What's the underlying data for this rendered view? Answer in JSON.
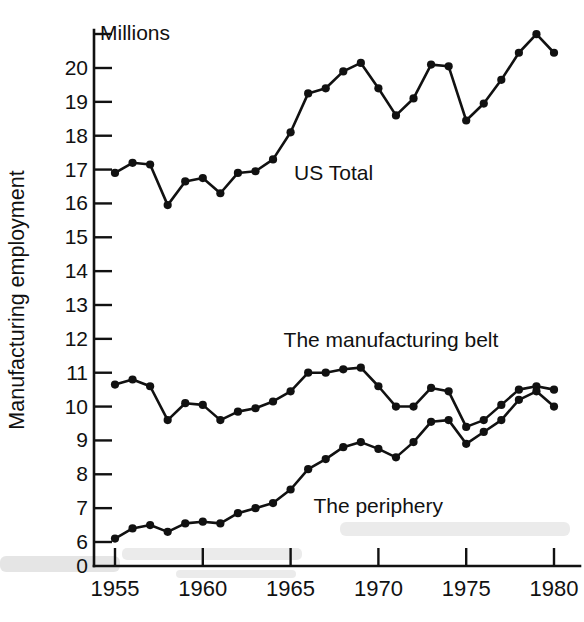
{
  "figure": {
    "unit_note": "Millions",
    "y_axis_title": "Manufacturing employment",
    "zero_label": "0"
  },
  "chart_data": {
    "type": "line",
    "title": "",
    "subtitle": "",
    "xlabel": "",
    "ylabel": "Manufacturing employment",
    "unit_note": "Millions",
    "grid": false,
    "legend_position": "inline-annotation",
    "xlim": [
      1954,
      1981
    ],
    "ylim": [
      5.6,
      21.2
    ],
    "yticks": [
      6,
      7,
      8,
      9,
      10,
      11,
      12,
      13,
      14,
      15,
      16,
      17,
      18,
      19,
      20
    ],
    "ytick_labels": [
      "6",
      "7",
      "8",
      "9",
      "10",
      "11",
      "12",
      "13",
      "14",
      "15",
      "16",
      "17",
      "18",
      "19",
      "20"
    ],
    "xticks": [
      1955,
      1960,
      1965,
      1970,
      1975,
      1980
    ],
    "xtick_labels": [
      "1955",
      "1960",
      "1965",
      "1970",
      "1975",
      "1980"
    ],
    "x": [
      1955,
      1956,
      1957,
      1958,
      1959,
      1960,
      1961,
      1962,
      1963,
      1964,
      1965,
      1966,
      1967,
      1968,
      1969,
      1970,
      1971,
      1972,
      1973,
      1974,
      1975,
      1976,
      1977,
      1978,
      1979,
      1980
    ],
    "series": [
      {
        "name": "US Total",
        "label": "US Total",
        "label_x": 1965.2,
        "label_y": 16.7,
        "values": [
          16.9,
          17.2,
          17.15,
          15.95,
          16.65,
          16.75,
          16.3,
          16.9,
          16.95,
          17.3,
          18.1,
          19.25,
          19.4,
          19.9,
          20.15,
          19.4,
          18.6,
          19.1,
          20.1,
          20.05,
          18.45,
          18.95,
          19.65,
          20.45,
          21.0,
          20.45
        ]
      },
      {
        "name": "The manufacturing belt",
        "label": "The manufacturing belt",
        "label_x": 1964.6,
        "label_y": 11.75,
        "values": [
          10.65,
          10.8,
          10.6,
          9.6,
          10.1,
          10.05,
          9.6,
          9.85,
          9.95,
          10.15,
          10.45,
          11.0,
          11.0,
          11.1,
          11.15,
          10.6,
          10.0,
          10.0,
          10.55,
          10.45,
          9.4,
          9.6,
          10.05,
          10.5,
          10.6,
          10.5
        ]
      },
      {
        "name": "The periphery",
        "label": "The periphery",
        "label_x": 1966.3,
        "label_y": 6.85,
        "values": [
          6.1,
          6.4,
          6.5,
          6.3,
          6.55,
          6.6,
          6.55,
          6.85,
          7.0,
          7.15,
          7.55,
          8.15,
          8.45,
          8.8,
          8.95,
          8.75,
          8.5,
          8.95,
          9.55,
          9.6,
          8.9,
          9.25,
          9.6,
          10.2,
          10.45,
          10.0
        ]
      }
    ]
  }
}
